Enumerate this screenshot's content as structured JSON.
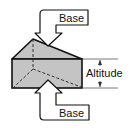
{
  "diagram": {
    "labels": {
      "top_base": "Base",
      "bottom_base": "Base",
      "altitude": "Altitude"
    },
    "colors": {
      "prism_fill": "#c4c4c4",
      "outline": "#111111",
      "background": "#ffffff"
    }
  }
}
